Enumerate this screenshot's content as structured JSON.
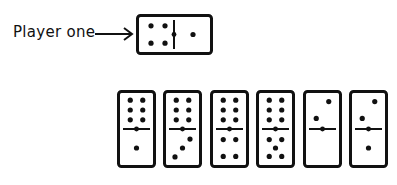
{
  "label": {
    "text": "Player one"
  },
  "colors": {
    "ink": "#111111",
    "background": "#ffffff"
  },
  "player_domino": {
    "orientation": "horizontal",
    "left": 4,
    "right": 1
  },
  "hand": [
    {
      "top": 6,
      "bottom": 1
    },
    {
      "top": 6,
      "bottom": 3
    },
    {
      "top": 6,
      "bottom": 4
    },
    {
      "top": 6,
      "bottom": 5
    },
    {
      "top": 2,
      "bottom": 0
    },
    {
      "top": 2,
      "bottom": 1
    }
  ]
}
